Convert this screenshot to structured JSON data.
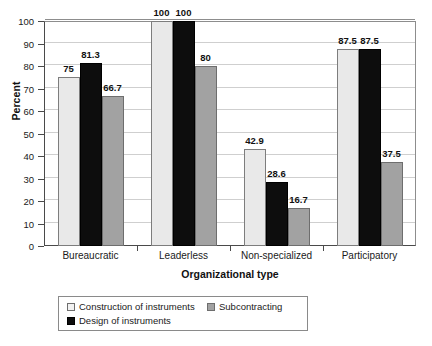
{
  "chart_data": {
    "type": "bar",
    "title": "",
    "xlabel": "Organizational type",
    "ylabel": "Percent",
    "ylim": [
      0,
      100
    ],
    "yticks": [
      0,
      10,
      20,
      30,
      40,
      50,
      60,
      70,
      80,
      90,
      100
    ],
    "grid": true,
    "legend_position": "bottom",
    "categories": [
      "Bureaucratic",
      "Leaderless",
      "Non-specialized",
      "Participatory"
    ],
    "series": [
      {
        "name": "Construction of instruments",
        "color": "#e9e9e9",
        "values": [
          75,
          100,
          42.9,
          87.5
        ],
        "labels": [
          "75",
          "100",
          "42.9",
          "87.5"
        ]
      },
      {
        "name": "Design of instruments",
        "color": "#0d0d0d",
        "values": [
          81.3,
          100,
          28.6,
          87.5
        ],
        "labels": [
          "81.3",
          "100",
          "28.6",
          "87.5"
        ]
      },
      {
        "name": "Subcontracting",
        "color": "#a2a2a2",
        "values": [
          66.7,
          80,
          16.7,
          37.5
        ],
        "labels": [
          "66.7",
          "80",
          "16.7",
          "37.5"
        ]
      }
    ]
  },
  "legend": {
    "items": [
      {
        "label": "Construction of instruments",
        "swatch": "light-gray-swatch"
      },
      {
        "label": "Design of instruments",
        "swatch": "black-swatch"
      },
      {
        "label": "Subcontracting",
        "swatch": "medium-gray-swatch"
      }
    ]
  }
}
